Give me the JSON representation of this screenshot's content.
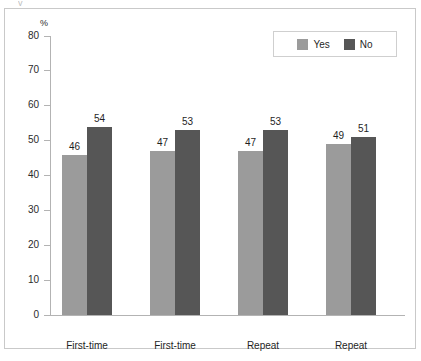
{
  "chart_data": {
    "type": "bar",
    "title": "",
    "xlabel": "",
    "ylabel": "%",
    "unit_label": "%",
    "ylim": [
      0,
      80
    ],
    "ytick_step": 10,
    "yticks": [
      "80",
      "70",
      "60",
      "50",
      "40",
      "30",
      "20",
      "10",
      "0"
    ],
    "grid": false,
    "legend_position": "top-right",
    "categories": [
      "First-time",
      "First-time",
      "Repeat",
      "Repeat"
    ],
    "series": [
      {
        "name": "Yes",
        "color": "#9b9b9b",
        "values": [
          46,
          47,
          47,
          49
        ]
      },
      {
        "name": "No",
        "color": "#565656",
        "values": [
          54,
          53,
          53,
          51
        ]
      }
    ],
    "bar_labels": [
      {
        "yes": "46",
        "no": "54"
      },
      {
        "yes": "47",
        "no": "53"
      },
      {
        "yes": "47",
        "no": "53"
      },
      {
        "yes": "49",
        "no": "51"
      }
    ]
  },
  "legend": {
    "items": [
      {
        "label": "Yes",
        "color": "#9b9b9b"
      },
      {
        "label": "No",
        "color": "#565656"
      }
    ]
  },
  "artifacts": {
    "top_cut_text": "y"
  },
  "colors": {
    "series_yes": "#9b9b9b",
    "series_no": "#565656",
    "axis": "#b3b3b3",
    "frame": "#c9c9c9",
    "text": "#1f1f1f",
    "background": "#ffffff"
  }
}
